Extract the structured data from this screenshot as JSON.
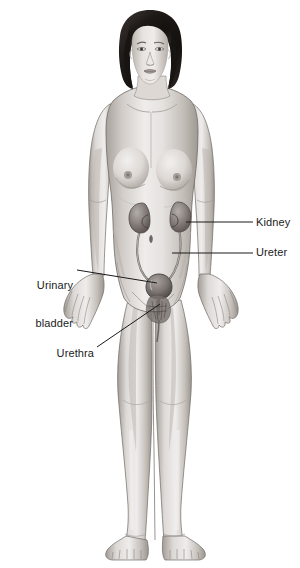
{
  "illustration": {
    "title": "Female urinary system anatomy",
    "subject": "adult female figure, anterior view, full body",
    "background_color": "#ffffff",
    "line_color": "#1a1a1a",
    "skin_light": "#f0eeec",
    "skin_mid": "#cfcac6",
    "skin_shadow": "#a9a39f",
    "hair_color": "#201c1a",
    "organ_color": "#8c8581",
    "organ_shadow": "#5d5653"
  },
  "labels": [
    {
      "id": "kidney",
      "text": "Kidney",
      "side": "right",
      "lines": [
        "Kidney"
      ],
      "leader": {
        "from_x": 186,
        "from_y": 222,
        "to_x": 253,
        "to_y": 222
      },
      "points_to": "right kidney"
    },
    {
      "id": "ureter",
      "text": "Ureter",
      "side": "right",
      "lines": [
        "Ureter"
      ],
      "leader": {
        "from_x": 172,
        "from_y": 253,
        "to_x": 253,
        "to_y": 253
      },
      "points_to": "right ureter"
    },
    {
      "id": "urinary-bladder",
      "text": "Urinary bladder",
      "side": "left",
      "lines": [
        "Urinary",
        "bladder"
      ],
      "leader": {
        "from_x": 77,
        "from_y": 270,
        "to_x": 157,
        "to_y": 283
      },
      "points_to": "urinary bladder"
    },
    {
      "id": "urethra",
      "text": "Urethra",
      "side": "left",
      "lines": [
        "Urethra"
      ],
      "leader": {
        "from_x": 97,
        "from_y": 347,
        "to_x": 160,
        "to_y": 304
      },
      "points_to": "urethra"
    }
  ],
  "organs": [
    {
      "name": "left kidney",
      "cx": 141,
      "cy": 217
    },
    {
      "name": "right kidney",
      "cx": 180,
      "cy": 216
    },
    {
      "name": "left ureter",
      "path": "from left kidney down to bladder"
    },
    {
      "name": "right ureter",
      "path": "from right kidney down to bladder"
    },
    {
      "name": "urinary bladder",
      "cx": 159,
      "cy": 284
    },
    {
      "name": "urethra",
      "cx": 160,
      "cy": 303
    }
  ],
  "body_regions": [
    {
      "name": "head",
      "cx": 150,
      "cy": 50
    },
    {
      "name": "hair",
      "cx": 150,
      "cy": 45
    },
    {
      "name": "neck",
      "cx": 150,
      "cy": 92
    },
    {
      "name": "torso",
      "cx": 152,
      "cy": 200
    },
    {
      "name": "left-breast",
      "cx": 131,
      "cy": 170
    },
    {
      "name": "right-breast",
      "cx": 174,
      "cy": 172
    },
    {
      "name": "navel",
      "cx": 152,
      "cy": 238
    },
    {
      "name": "left-arm",
      "cx": 101,
      "cy": 220
    },
    {
      "name": "right-arm",
      "cx": 210,
      "cy": 222
    },
    {
      "name": "left-hand",
      "cx": 81,
      "cy": 298
    },
    {
      "name": "right-hand",
      "cx": 231,
      "cy": 300
    },
    {
      "name": "left-leg",
      "cx": 136,
      "cy": 430
    },
    {
      "name": "right-leg",
      "cx": 172,
      "cy": 430
    },
    {
      "name": "left-foot",
      "cx": 133,
      "cy": 540
    },
    {
      "name": "right-foot",
      "cx": 174,
      "cy": 540
    }
  ]
}
